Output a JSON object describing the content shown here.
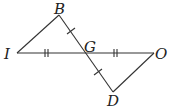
{
  "figure": {
    "points": {
      "I": {
        "label": "I",
        "x": 17,
        "y": 53
      },
      "B": {
        "label": "B",
        "x": 59,
        "y": 15
      },
      "G": {
        "label": "G",
        "x": 84,
        "y": 53
      },
      "O": {
        "label": "O",
        "x": 154,
        "y": 53
      },
      "D": {
        "label": "D",
        "x": 113,
        "y": 92
      }
    },
    "segments": [
      "IB",
      "IO",
      "BD",
      "OD"
    ],
    "congruence_marks": [
      {
        "segments": [
          "BG",
          "GD"
        ],
        "ticks": 1
      },
      {
        "segments": [
          "IG",
          "GO"
        ],
        "ticks": 2
      }
    ],
    "colors": {
      "line": "#333333",
      "text": "#222222",
      "background": "#ffffff"
    }
  }
}
